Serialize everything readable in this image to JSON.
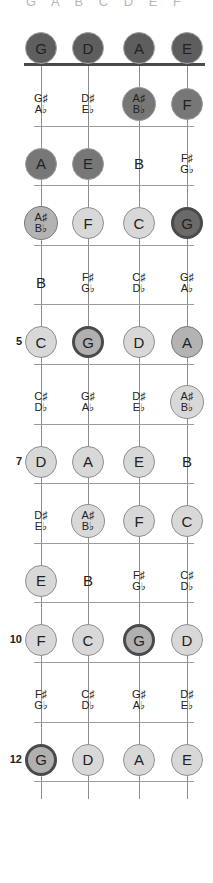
{
  "diagram": {
    "type": "bass-fretboard",
    "title_clipped": "G A B C D E F",
    "instrument_strings": [
      "G",
      "D",
      "A",
      "E"
    ],
    "fret_count": 12,
    "marked_frets": [
      "5",
      "7",
      "10",
      "12"
    ],
    "fret_number_labels": {
      "f5": "5",
      "f7": "7",
      "f10": "10",
      "f12": "12"
    },
    "colors": {
      "open_string": "#5e5e5e",
      "light": "#d8d8d8",
      "mid": "#b3b3b3",
      "dark": "#777777",
      "root_ring": "#4a4a4a",
      "nut": "#4a4a4a",
      "fret_line": "#9a9a9a",
      "string_line": "#8d8d8d"
    },
    "open_notes": [
      {
        "label": "G",
        "shade": "darker"
      },
      {
        "label": "D",
        "shade": "darker"
      },
      {
        "label": "A",
        "shade": "darker"
      },
      {
        "label": "E",
        "shade": "darker"
      }
    ],
    "frets": [
      {
        "number": 1,
        "notes": [
          {
            "sharp": "G♯",
            "flat": "A♭",
            "shade": "none"
          },
          {
            "sharp": "D♯",
            "flat": "E♭",
            "shade": "none"
          },
          {
            "sharp": "A♯",
            "flat": "B♭",
            "shade": "dark"
          },
          {
            "label": "F",
            "shade": "dark"
          }
        ]
      },
      {
        "number": 2,
        "notes": [
          {
            "label": "A",
            "shade": "dark"
          },
          {
            "label": "E",
            "shade": "dark"
          },
          {
            "label": "B",
            "shade": "none"
          },
          {
            "sharp": "F♯",
            "flat": "G♭",
            "shade": "none"
          }
        ]
      },
      {
        "number": 3,
        "notes": [
          {
            "sharp": "A♯",
            "flat": "B♭",
            "shade": "mid"
          },
          {
            "label": "F",
            "shade": "light"
          },
          {
            "label": "C",
            "shade": "light"
          },
          {
            "label": "G",
            "shade": "rootdark"
          }
        ]
      },
      {
        "number": 4,
        "notes": [
          {
            "label": "B",
            "shade": "none"
          },
          {
            "sharp": "F♯",
            "flat": "G♭",
            "shade": "none"
          },
          {
            "sharp": "C♯",
            "flat": "D♭",
            "shade": "none"
          },
          {
            "sharp": "G♯",
            "flat": "A♭",
            "shade": "none"
          }
        ]
      },
      {
        "number": 5,
        "notes": [
          {
            "label": "C",
            "shade": "light"
          },
          {
            "label": "G",
            "shade": "root"
          },
          {
            "label": "D",
            "shade": "light"
          },
          {
            "label": "A",
            "shade": "mid"
          }
        ]
      },
      {
        "number": 6,
        "notes": [
          {
            "sharp": "C♯",
            "flat": "D♭",
            "shade": "none"
          },
          {
            "sharp": "G♯",
            "flat": "A♭",
            "shade": "none"
          },
          {
            "sharp": "D♯",
            "flat": "E♭",
            "shade": "none"
          },
          {
            "sharp": "A♯",
            "flat": "B♭",
            "shade": "light"
          }
        ]
      },
      {
        "number": 7,
        "notes": [
          {
            "label": "D",
            "shade": "light"
          },
          {
            "label": "A",
            "shade": "light"
          },
          {
            "label": "E",
            "shade": "light"
          },
          {
            "label": "B",
            "shade": "none"
          }
        ]
      },
      {
        "number": 8,
        "notes": [
          {
            "sharp": "D♯",
            "flat": "E♭",
            "shade": "none"
          },
          {
            "sharp": "A♯",
            "flat": "B♭",
            "shade": "light"
          },
          {
            "label": "F",
            "shade": "light"
          },
          {
            "label": "C",
            "shade": "light"
          }
        ]
      },
      {
        "number": 9,
        "notes": [
          {
            "label": "E",
            "shade": "light"
          },
          {
            "label": "B",
            "shade": "none"
          },
          {
            "sharp": "F♯",
            "flat": "G♭",
            "shade": "none"
          },
          {
            "sharp": "C♯",
            "flat": "D♭",
            "shade": "none"
          }
        ]
      },
      {
        "number": 10,
        "notes": [
          {
            "label": "F",
            "shade": "light"
          },
          {
            "label": "C",
            "shade": "light"
          },
          {
            "label": "G",
            "shade": "root"
          },
          {
            "label": "D",
            "shade": "light"
          }
        ]
      },
      {
        "number": 11,
        "notes": [
          {
            "sharp": "F♯",
            "flat": "G♭",
            "shade": "none"
          },
          {
            "sharp": "C♯",
            "flat": "D♭",
            "shade": "none"
          },
          {
            "sharp": "G♯",
            "flat": "A♭",
            "shade": "none"
          },
          {
            "sharp": "D♯",
            "flat": "E♭",
            "shade": "none"
          }
        ]
      },
      {
        "number": 12,
        "notes": [
          {
            "label": "G",
            "shade": "root"
          },
          {
            "label": "D",
            "shade": "light"
          },
          {
            "label": "A",
            "shade": "light"
          },
          {
            "label": "E",
            "shade": "light"
          }
        ]
      }
    ]
  }
}
